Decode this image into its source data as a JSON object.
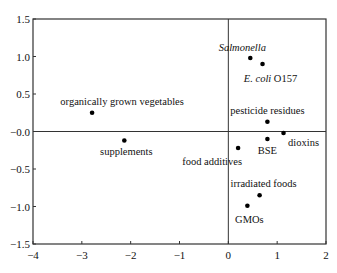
{
  "chart_data": {
    "type": "scatter",
    "title": "",
    "xlabel": "",
    "ylabel": "",
    "xlim": [
      -4,
      2
    ],
    "ylim": [
      -1.5,
      1.5
    ],
    "grid": false,
    "legend": null,
    "reference_lines": {
      "x": 0,
      "y": 0
    },
    "x_ticks": [
      -4,
      -3,
      -2,
      -1,
      0,
      1,
      2
    ],
    "x_tick_labels": [
      "−4",
      "−3",
      "−2",
      "−1",
      "0",
      "1",
      "2"
    ],
    "y_ticks": [
      1.5,
      1.0,
      0.5,
      0.0,
      -0.5,
      -1.0,
      -1.5
    ],
    "y_tick_labels": [
      "1.5",
      "1.0",
      "0.5",
      "−0.0",
      "−0.5",
      "−1.0",
      "−1.5"
    ],
    "points": [
      {
        "label": "Salmonella",
        "italic_part": "Salmonella",
        "rest": "",
        "x": 0.45,
        "y": 0.98,
        "label_dx": -8,
        "label_dy": -7,
        "anchor": "middle"
      },
      {
        "label": "E. coli O157",
        "italic_part": "E. coli",
        "rest": " O157",
        "x": 0.7,
        "y": 0.9,
        "label_dx": 8,
        "label_dy": 18,
        "anchor": "middle"
      },
      {
        "label": "pesticide residues",
        "italic_part": "",
        "rest": "pesticide residues",
        "x": 0.8,
        "y": 0.13,
        "label_dx": 0,
        "label_dy": -8,
        "anchor": "middle"
      },
      {
        "label": "dioxins",
        "italic_part": "",
        "rest": "dioxins",
        "x": 1.13,
        "y": -0.02,
        "label_dx": 20,
        "label_dy": 13,
        "anchor": "middle"
      },
      {
        "label": "BSE",
        "italic_part": "",
        "rest": "BSE",
        "x": 0.8,
        "y": -0.1,
        "label_dx": 0,
        "label_dy": 15,
        "anchor": "middle"
      },
      {
        "label": "food additives",
        "italic_part": "",
        "rest": "food additives",
        "x": 0.2,
        "y": -0.22,
        "label_dx": -26,
        "label_dy": 17,
        "anchor": "middle"
      },
      {
        "label": "irradiated foods",
        "italic_part": "",
        "rest": "irradiated foods",
        "x": 0.64,
        "y": -0.85,
        "label_dx": 4,
        "label_dy": -8,
        "anchor": "middle"
      },
      {
        "label": "GMOs",
        "italic_part": "",
        "rest": "GMOs",
        "x": 0.39,
        "y": -0.99,
        "label_dx": 2,
        "label_dy": 17,
        "anchor": "middle"
      },
      {
        "label": "organically grown vegetables",
        "italic_part": "",
        "rest": "organically grown vegetables",
        "x": -2.79,
        "y": 0.25,
        "label_dx": 30,
        "label_dy": -8,
        "anchor": "middle"
      },
      {
        "label": "supplements",
        "italic_part": "",
        "rest": "supplements",
        "x": -2.13,
        "y": -0.12,
        "label_dx": 2,
        "label_dy": 14,
        "anchor": "middle"
      }
    ]
  },
  "style": {
    "axis_color": "#333333",
    "point_color": "#000000"
  }
}
